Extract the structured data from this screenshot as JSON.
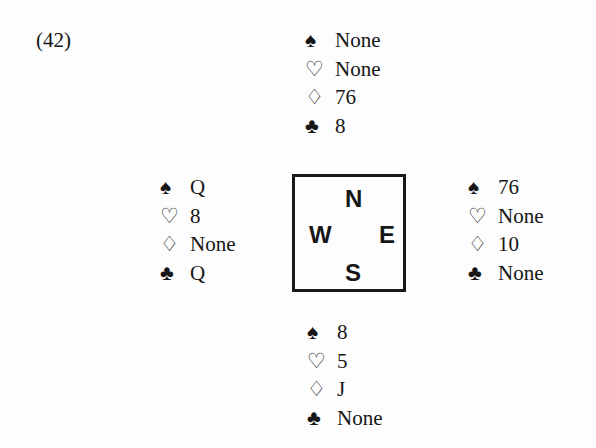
{
  "problem_label": "(42)",
  "suit_glyphs": {
    "spades": "♠",
    "hearts": "♡",
    "diamonds": "♢",
    "clubs": "♣"
  },
  "compass": {
    "north": "N",
    "south": "S",
    "east": "E",
    "west": "W"
  },
  "hands": {
    "north": {
      "spades": "None",
      "hearts": "None",
      "diamonds": "76",
      "clubs": "8"
    },
    "west": {
      "spades": "Q",
      "hearts": "8",
      "diamonds": "None",
      "clubs": "Q"
    },
    "east": {
      "spades": "76",
      "hearts": "None",
      "diamonds": "10",
      "clubs": "None"
    },
    "south": {
      "spades": "8",
      "hearts": "5",
      "diamonds": "J",
      "clubs": "None"
    }
  }
}
